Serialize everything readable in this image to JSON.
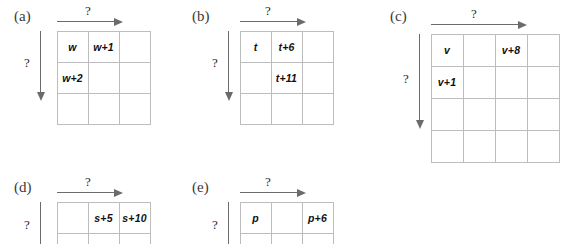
{
  "figure": {
    "question_mark": "?",
    "grid_line_color": "#bdbdbd",
    "arrow_color": "#6b6b6b",
    "text_color": "#111111"
  },
  "panels": [
    {
      "id": "a",
      "label": "(a)",
      "grid": {
        "cols": 3,
        "rows": 3,
        "cell": 31
      },
      "entries": [
        {
          "text": "w",
          "col": 1,
          "row": 1
        },
        {
          "text": "w+1",
          "col": 2,
          "row": 1
        },
        {
          "text": "w+2",
          "col": 1,
          "row": 2
        }
      ],
      "arrows": {
        "horizontal": {
          "label": "?",
          "span_cells": 2
        },
        "vertical": {
          "label": "?",
          "span_cells": 2
        }
      }
    },
    {
      "id": "b",
      "label": "(b)",
      "grid": {
        "cols": 3,
        "rows": 3,
        "cell": 31
      },
      "entries": [
        {
          "text": "t",
          "col": 1,
          "row": 1
        },
        {
          "text": "t+6",
          "col": 2,
          "row": 1
        },
        {
          "text": "t+11",
          "col": 2,
          "row": 2
        }
      ],
      "arrows": {
        "horizontal": {
          "label": "?",
          "span_cells": 2
        },
        "vertical": {
          "label": "?",
          "span_cells": 2
        }
      }
    },
    {
      "id": "c",
      "label": "(c)",
      "grid": {
        "cols": 4,
        "rows": 4,
        "cell": 32
      },
      "entries": [
        {
          "text": "v",
          "col": 1,
          "row": 1
        },
        {
          "text": "v+8",
          "col": 3,
          "row": 1
        },
        {
          "text": "v+1",
          "col": 1,
          "row": 2
        }
      ],
      "arrows": {
        "horizontal": {
          "label": "?",
          "span_cells": 4
        },
        "vertical": {
          "label": "?",
          "span_cells": 3
        }
      }
    },
    {
      "id": "d",
      "label": "(d)",
      "grid": {
        "cols": 3,
        "rows": 3,
        "cell": 31
      },
      "entries": [
        {
          "text": "s+5",
          "col": 2,
          "row": 1
        },
        {
          "text": "s+10",
          "col": 3,
          "row": 1
        }
      ],
      "arrows": {
        "horizontal": {
          "label": "?",
          "span_cells": 2
        },
        "vertical": {
          "label": "?",
          "span_cells": 2
        }
      }
    },
    {
      "id": "e",
      "label": "(e)",
      "grid": {
        "cols": 3,
        "rows": 3,
        "cell": 31
      },
      "entries": [
        {
          "text": "p",
          "col": 1,
          "row": 1
        },
        {
          "text": "p+6",
          "col": 3,
          "row": 1
        }
      ],
      "arrows": {
        "horizontal": {
          "label": "?",
          "span_cells": 2
        },
        "vertical": {
          "label": "?",
          "span_cells": 2
        }
      }
    }
  ]
}
